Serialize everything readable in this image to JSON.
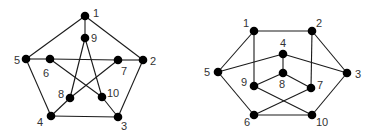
{
  "diagrams": [
    {
      "id": "left",
      "name": "petersen-graph-star-drawing",
      "nodes": [
        {
          "id": "1",
          "x": 85,
          "y": 16,
          "lx": 93,
          "ly": 17
        },
        {
          "id": "2",
          "x": 143,
          "y": 60,
          "lx": 150,
          "ly": 65
        },
        {
          "id": "3",
          "x": 118,
          "y": 117,
          "lx": 121,
          "ly": 130
        },
        {
          "id": "4",
          "x": 51,
          "y": 116,
          "lx": 37,
          "ly": 126
        },
        {
          "id": "5",
          "x": 26,
          "y": 59,
          "lx": 14,
          "ly": 64
        },
        {
          "id": "6",
          "x": 50,
          "y": 59,
          "lx": 43,
          "ly": 77
        },
        {
          "id": "7",
          "x": 118,
          "y": 60,
          "lx": 121,
          "ly": 75
        },
        {
          "id": "8",
          "x": 70,
          "y": 98,
          "lx": 58,
          "ly": 98
        },
        {
          "id": "9",
          "x": 85,
          "y": 38,
          "lx": 91,
          "ly": 42
        },
        {
          "id": "10",
          "x": 102,
          "y": 97,
          "lx": 107,
          "ly": 97
        }
      ],
      "edges": [
        [
          "1",
          "2"
        ],
        [
          "2",
          "3"
        ],
        [
          "3",
          "4"
        ],
        [
          "4",
          "5"
        ],
        [
          "5",
          "1"
        ],
        [
          "1",
          "9"
        ],
        [
          "2",
          "7"
        ],
        [
          "3",
          "10"
        ],
        [
          "4",
          "8"
        ],
        [
          "5",
          "6"
        ],
        [
          "9",
          "8"
        ],
        [
          "9",
          "10"
        ],
        [
          "6",
          "7"
        ],
        [
          "6",
          "10"
        ],
        [
          "7",
          "8"
        ]
      ]
    },
    {
      "id": "right",
      "name": "petersen-graph-hexagonal-drawing",
      "nodes": [
        {
          "id": "1",
          "x": 254,
          "y": 31,
          "lx": 243,
          "ly": 27
        },
        {
          "id": "2",
          "x": 312,
          "y": 31,
          "lx": 316,
          "ly": 27
        },
        {
          "id": "3",
          "x": 347,
          "y": 73,
          "lx": 355,
          "ly": 78
        },
        {
          "id": "4",
          "x": 283,
          "y": 54,
          "lx": 280,
          "ly": 47
        },
        {
          "id": "5",
          "x": 218,
          "y": 72,
          "lx": 204,
          "ly": 76
        },
        {
          "id": "6",
          "x": 254,
          "y": 115,
          "lx": 244,
          "ly": 126
        },
        {
          "id": "7",
          "x": 311,
          "y": 88,
          "lx": 317,
          "ly": 89
        },
        {
          "id": "8",
          "x": 283,
          "y": 73,
          "lx": 279,
          "ly": 88
        },
        {
          "id": "9",
          "x": 254,
          "y": 86,
          "lx": 241,
          "ly": 86
        },
        {
          "id": "10",
          "x": 312,
          "y": 115,
          "lx": 316,
          "ly": 126
        }
      ],
      "edges": [
        [
          "1",
          "2"
        ],
        [
          "1",
          "5"
        ],
        [
          "1",
          "9"
        ],
        [
          "2",
          "3"
        ],
        [
          "2",
          "7"
        ],
        [
          "3",
          "4"
        ],
        [
          "3",
          "10"
        ],
        [
          "4",
          "5"
        ],
        [
          "4",
          "8"
        ],
        [
          "5",
          "6"
        ],
        [
          "6",
          "10"
        ],
        [
          "6",
          "7"
        ],
        [
          "8",
          "9"
        ],
        [
          "8",
          "7"
        ],
        [
          "9",
          "10"
        ]
      ]
    }
  ]
}
